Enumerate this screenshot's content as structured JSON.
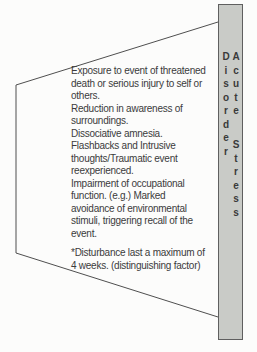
{
  "diagram": {
    "title_bar": {
      "label": "Acute Stress Disorder",
      "fill_color": "#c9cbc7",
      "border_color": "#5f5f5f"
    },
    "panel": {
      "outline_color": "#4f4f4f",
      "text_color": "#3b3b3b",
      "symptom_lines": [
        "Exposure to event of threatened",
        "death or serious injury to self or",
        "others.",
        "Reduction in awareness of",
        "surroundings.",
        "Dissociative amnesia.",
        "Flashbacks and Intrusive",
        "thoughts/Traumatic event",
        "reexperienced.",
        "Impairment of occupational",
        "function. (e.g.) Marked",
        "avoidance of environmental",
        "stimuli, triggering recall of the",
        "event."
      ],
      "note_lines": [
        "*Disturbance last a maximum of",
        "4 weeks. (distinguishing factor)"
      ]
    }
  }
}
